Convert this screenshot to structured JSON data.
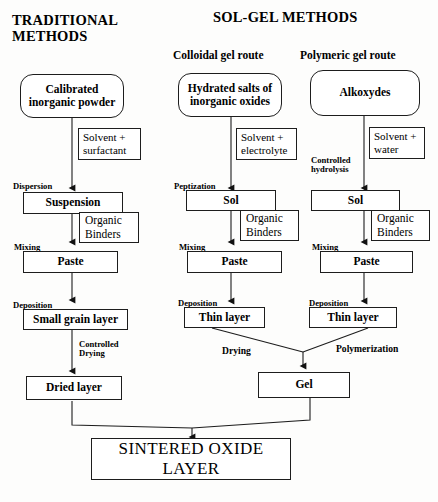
{
  "diagram": {
    "title_left": "TRADITIONAL\nMETHODS",
    "title_right": "SOL-GEL METHODS",
    "route_colloidal": "Colloidal gel route",
    "route_polymeric": "Polymeric gel route",
    "stroke_color": "#1d1d1d",
    "background": "#fdfdfc"
  },
  "columns": {
    "traditional": {
      "start": "Calibrated\ninorganic powder",
      "reagent": "Solvent +\nsurfactant",
      "step1": "Dispersion",
      "node1": "Suspension",
      "binders": "Organic\nBinders",
      "step2": "Mixing",
      "node2": "Paste",
      "step3": "Deposition",
      "node3": "Small grain layer",
      "step4": "Controlled\nDrying",
      "node4": "Dried layer"
    },
    "colloidal": {
      "start": "Hydrated salts of\ninorganic oxides",
      "reagent": "Solvent +\nelectrolyte",
      "step1": "Peptization",
      "node1": "Sol",
      "binders": "Organic\nBinders",
      "step2": "Mixing",
      "node2": "Paste",
      "step3": "Deposition",
      "node3": "Thin layer",
      "step4": "Drying"
    },
    "polymeric": {
      "start": "Alkoxydes",
      "reagent": "Solvent +\nwater",
      "step1": "Controlled\nhydrolysis",
      "node1": "Sol",
      "binders": "Organic\nBinders",
      "step2": "Mixing",
      "node2": "Paste",
      "step3": "Deposition",
      "node3": "Thin layer",
      "step4": "Polymerization"
    }
  },
  "merge": {
    "gel": "Gel",
    "final": "SINTERED OXIDE LAYER"
  }
}
